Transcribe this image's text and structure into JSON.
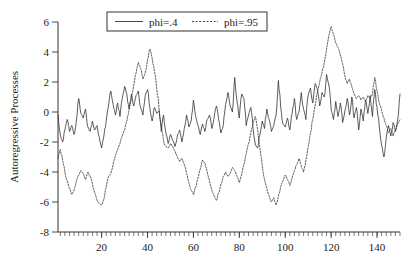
{
  "chart_data": {
    "type": "line",
    "title": "",
    "xlabel": "",
    "ylabel": "Autoregressive Processes",
    "xlim": [
      1,
      150
    ],
    "ylim": [
      -8,
      6
    ],
    "grid": false,
    "legend_position": "top-center",
    "y_ticks": [
      6,
      4,
      2,
      0,
      -2,
      -4,
      -6,
      -8
    ],
    "y_tick_labels": [
      "6",
      "4",
      "2",
      "0",
      "-2",
      "-4",
      "-6",
      "-8"
    ],
    "x_ticks": [
      20,
      40,
      60,
      80,
      100,
      120,
      140
    ],
    "x_tick_labels": [
      "20",
      "40",
      "60",
      "80",
      "100",
      "120",
      "140"
    ],
    "x_minor_tick_step": 2,
    "series": [
      {
        "name": "phi=.4",
        "style": "solid",
        "color": "#333333",
        "values": [
          -0.2,
          -1.5,
          -2.0,
          -1.2,
          -0.5,
          -1.3,
          -0.9,
          -1.5,
          -0.6,
          0.9,
          -0.1,
          -0.4,
          0.2,
          -1.0,
          -1.3,
          -0.6,
          -1.2,
          -0.9,
          -1.7,
          -2.4,
          -1.6,
          -0.6,
          0.4,
          1.4,
          0.5,
          -0.2,
          0.6,
          -0.3,
          0.9,
          1.7,
          1.2,
          0.2,
          1.2,
          0.4,
          1.1,
          1.4,
          0.3,
          -0.2,
          1.1,
          1.5,
          0.3,
          -0.6,
          0.3,
          -0.1,
          0.1,
          -1.3,
          -0.2,
          -1.4,
          -2.1,
          -1.5,
          -1.9,
          -2.3,
          -1.6,
          -1.2,
          -2.0,
          -1.1,
          -0.2,
          -1.0,
          -0.6,
          0.8,
          -0.3,
          -0.9,
          -1.5,
          -0.8,
          -1.3,
          -0.5,
          -0.2,
          -1.1,
          -0.4,
          0.4,
          -0.5,
          -1.4,
          -0.9,
          0.5,
          1.3,
          0.4,
          0.0,
          2.3,
          0.7,
          -0.4,
          1.2,
          0.9,
          -0.9,
          -0.2,
          0.3,
          -1.1,
          -2.2,
          -2.4,
          -1.5,
          -0.6,
          -1.1,
          0.2,
          -0.5,
          -1.3,
          -0.9,
          -0.2,
          2.1,
          0.4,
          -0.8,
          -1.0,
          -0.4,
          -1.2,
          -0.1,
          0.9,
          -0.5,
          0.0,
          1.3,
          0.2,
          -0.5,
          1.1,
          1.6,
          0.6,
          1.9,
          1.5,
          0.4,
          1.3,
          1.0,
          2.5,
          1.8,
          0.2,
          -0.5,
          0.7,
          -0.3,
          0.6,
          -0.7,
          0.1,
          0.9,
          -0.2,
          1.0,
          -0.4,
          0.3,
          -1.2,
          0.2,
          -0.6,
          0.8,
          -0.1,
          1.1,
          -0.3,
          1.5,
          0.3,
          -1.0,
          -2.2,
          -3.0,
          -1.7,
          -0.9,
          -1.6,
          -0.7,
          -1.3,
          -0.5,
          1.2
        ]
      },
      {
        "name": "phi=.95",
        "style": "dashed",
        "color": "#3a3a3a",
        "values": [
          -3.1,
          -2.5,
          -3.2,
          -4.0,
          -4.6,
          -5.1,
          -5.5,
          -5.2,
          -4.6,
          -4.2,
          -3.9,
          -4.1,
          -4.5,
          -4.0,
          -4.3,
          -4.8,
          -5.4,
          -5.9,
          -6.1,
          -6.2,
          -5.8,
          -5.0,
          -4.3,
          -4.1,
          -3.5,
          -2.9,
          -2.5,
          -2.1,
          -1.6,
          -1.2,
          -0.6,
          0.2,
          0.9,
          1.8,
          2.6,
          3.3,
          2.9,
          2.2,
          2.6,
          3.5,
          4.2,
          3.6,
          2.7,
          1.6,
          0.3,
          -0.9,
          -2.0,
          -2.3,
          -2.4,
          -2.1,
          -2.3,
          -2.6,
          -3.0,
          -3.3,
          -3.1,
          -3.5,
          -4.1,
          -4.7,
          -5.2,
          -5.5,
          -5.0,
          -4.4,
          -3.8,
          -3.2,
          -3.4,
          -4.0,
          -4.6,
          -5.2,
          -5.6,
          -5.9,
          -5.4,
          -4.8,
          -4.3,
          -4.0,
          -4.3,
          -4.1,
          -3.7,
          -3.9,
          -4.3,
          -4.7,
          -4.2,
          -3.5,
          -2.8,
          -2.1,
          -1.4,
          -0.7,
          -0.3,
          -1.2,
          -2.4,
          -3.6,
          -4.5,
          -5.1,
          -5.6,
          -6.0,
          -5.7,
          -6.2,
          -5.6,
          -5.0,
          -4.6,
          -4.2,
          -4.5,
          -4.9,
          -4.4,
          -3.9,
          -3.5,
          -3.1,
          -3.6,
          -4.0,
          -3.2,
          -2.3,
          -1.4,
          -0.5,
          0.4,
          1.3,
          2.0,
          2.6,
          3.3,
          4.2,
          5.1,
          5.7,
          5.2,
          4.6,
          4.3,
          3.8,
          3.2,
          2.4,
          1.9,
          2.2,
          1.7,
          1.2,
          0.9,
          1.1,
          0.8,
          1.0,
          0.7,
          1.1,
          0.9,
          1.2,
          2.3,
          1.4,
          0.6,
          0.1,
          -0.4,
          -0.9,
          -1.4,
          -1.1,
          -1.6,
          -1.2,
          -0.8,
          -0.5
        ]
      }
    ]
  },
  "legend": {
    "entries": [
      {
        "label": "phi=.4",
        "style": "solid"
      },
      {
        "label": "phi=.95",
        "style": "dashed"
      }
    ]
  }
}
